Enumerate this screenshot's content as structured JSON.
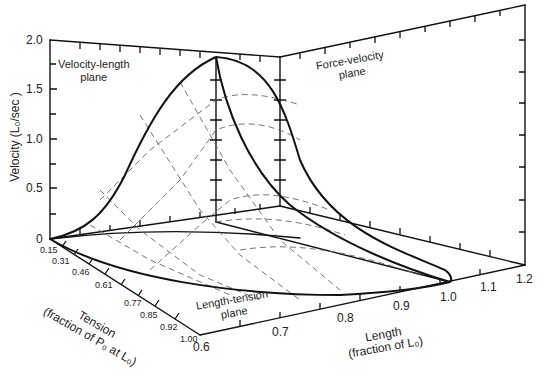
{
  "figure": {
    "type": "3d-surface-diagram",
    "axes": {
      "velocity": {
        "label": "Velocity (L₀/sec )",
        "ticks": [
          "0",
          "0.5",
          "1.0",
          "1.5",
          "2.0"
        ]
      },
      "tension": {
        "label_line1": "Tension",
        "label_line2": "(fraction of P₀ at L₀)",
        "ticks": [
          "0.15",
          "0.31",
          "0.46",
          "0.61",
          "0.77",
          "0.85",
          "0.92",
          "1.00"
        ]
      },
      "length": {
        "label_line1": "Length",
        "label_line2": "(fraction of L₀)",
        "ticks": [
          "0.6",
          "0.7",
          "0.8",
          "0.9",
          "1.0",
          "1.1",
          "1.2"
        ]
      }
    },
    "planes": {
      "velocity_length": {
        "line1": "Velocity-length",
        "line2": "plane"
      },
      "force_velocity": {
        "line1": "Force-velocity",
        "line2": "plane"
      },
      "length_tension": {
        "line1": "Length-tension",
        "line2": "plane"
      }
    }
  }
}
